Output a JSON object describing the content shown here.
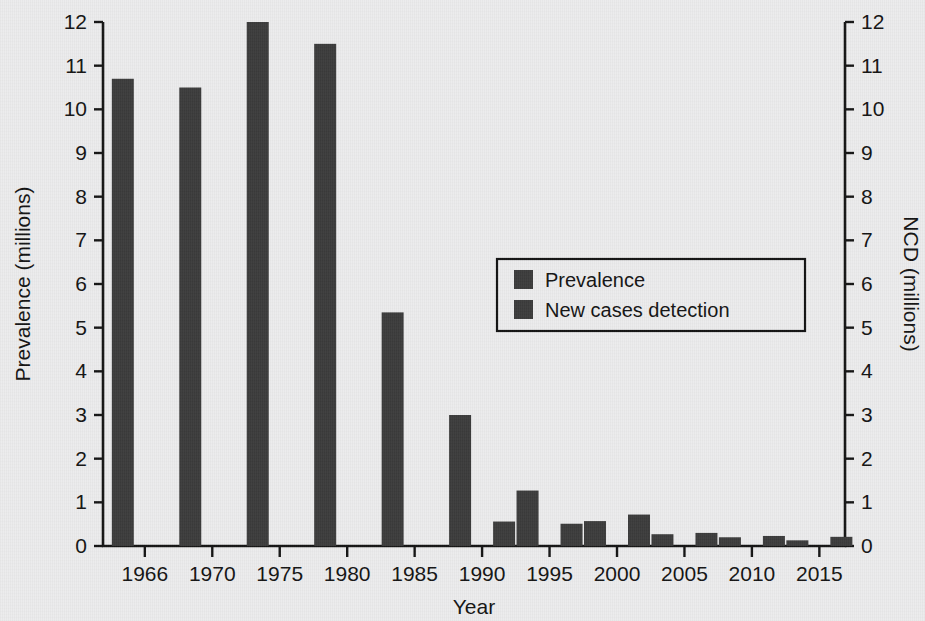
{
  "chart_data": {
    "type": "bar",
    "title": "",
    "xlabel": "Year",
    "ylabel": "Prevalence (millions)",
    "y2label": "NCD (millions)",
    "categories": [
      "1966",
      "1970",
      "1975",
      "1980",
      "1985",
      "1990",
      "1995",
      "2000",
      "2005",
      "2010",
      "2015"
    ],
    "xtick_labels": [
      "1966",
      "1970",
      "1975",
      "1980",
      "1985",
      "1990",
      "1995",
      "2000",
      "2005",
      "2010",
      "2015"
    ],
    "ytick_labels": [
      "0",
      "1",
      "2",
      "3",
      "4",
      "5",
      "6",
      "7",
      "8",
      "9",
      "10",
      "11",
      "12"
    ],
    "y2tick_labels": [
      "0",
      "1",
      "2",
      "3",
      "4",
      "5",
      "6",
      "7",
      "8",
      "9",
      "10",
      "11",
      "12"
    ],
    "ylim": [
      0,
      12
    ],
    "y2lim": [
      0,
      12
    ],
    "grid": false,
    "legend_position": "center-right",
    "series": [
      {
        "name": "Prevalence",
        "axis": "left",
        "color": "#3b3b3b",
        "values": [
          10.7,
          10.5,
          12.0,
          11.5,
          5.35,
          3.0,
          1.27,
          0.57,
          0.27,
          0.2,
          0.13
        ]
      },
      {
        "name": "New cases detection",
        "axis": "right",
        "color": "#3b3b3b",
        "values": [
          null,
          null,
          null,
          null,
          null,
          0.56,
          0.51,
          0.72,
          0.3,
          0.23,
          0.21
        ]
      }
    ]
  },
  "legend": {
    "entries": [
      {
        "label": "Prevalence"
      },
      {
        "label": "New cases detection"
      }
    ]
  },
  "colors": {
    "bar": "#3b3b3b",
    "axis": "#141414",
    "background": "#ececed"
  }
}
